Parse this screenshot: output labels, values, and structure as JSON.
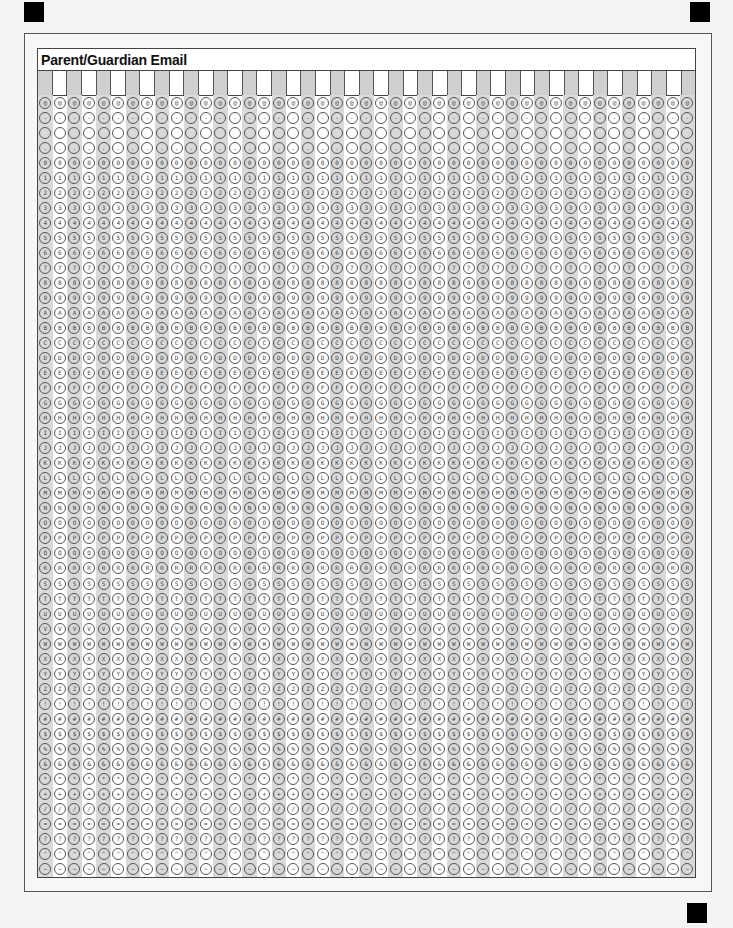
{
  "form": {
    "title": "Parent/Guardian Email",
    "column_count": 45,
    "rows": [
      "@",
      "-",
      " ",
      ".",
      "0",
      "1",
      "2",
      "3",
      "4",
      "5",
      "6",
      "7",
      "8",
      "9",
      "A",
      "B",
      "C",
      "D",
      "E",
      "F",
      "G",
      "H",
      "I",
      "J",
      "K",
      "L",
      "M",
      "N",
      "O",
      "P",
      "Q",
      "R",
      "S",
      "T",
      "U",
      "V",
      "W",
      "X",
      "Y",
      "Z",
      "!",
      "#",
      "$",
      "%",
      "&",
      "*",
      "+",
      "/",
      "=",
      "?",
      "^",
      "~"
    ]
  },
  "colors": {
    "shade": "#d0d0d0",
    "border": "#555555",
    "registration_mark": "#000000"
  }
}
